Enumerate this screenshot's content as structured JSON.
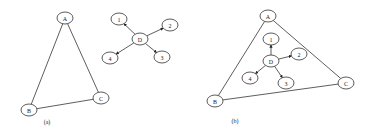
{
  "panels": [
    {
      "caption": "(a)",
      "caption_pos": [
        47,
        124
      ],
      "nodes": [
        {
          "id": "A",
          "label": "A",
          "x": 65,
          "y": 18
        },
        {
          "id": "B",
          "label": "B",
          "x": 29,
          "y": 110
        },
        {
          "id": "C",
          "label": "C",
          "x": 101,
          "y": 98
        },
        {
          "id": "D",
          "label": "D",
          "x": 140,
          "y": 39
        },
        {
          "id": "1",
          "label": "1",
          "x": 119,
          "y": 19
        },
        {
          "id": "2",
          "label": "2",
          "x": 170,
          "y": 25
        },
        {
          "id": "3",
          "label": "3",
          "x": 162,
          "y": 57
        },
        {
          "id": "4",
          "label": "4",
          "x": 110,
          "y": 58
        }
      ],
      "edges": [
        {
          "from": "A",
          "to": "B",
          "directed": false
        },
        {
          "from": "A",
          "to": "C",
          "directed": false
        },
        {
          "from": "B",
          "to": "C",
          "directed": false
        },
        {
          "from": "D",
          "to": "1",
          "directed": true
        },
        {
          "from": "D",
          "to": "2",
          "directed": true
        },
        {
          "from": "D",
          "to": "3",
          "directed": true
        },
        {
          "from": "D",
          "to": "4",
          "directed": true
        }
      ]
    },
    {
      "caption": "(b)",
      "caption_pos": [
        235,
        123
      ],
      "nodes": [
        {
          "id": "A",
          "label": "A",
          "x": 268,
          "y": 16
        },
        {
          "id": "B",
          "label": "B",
          "x": 215,
          "y": 101
        },
        {
          "id": "C",
          "label": "C",
          "x": 346,
          "y": 83
        },
        {
          "id": "D",
          "label": "D",
          "x": 271,
          "y": 61
        },
        {
          "id": "1",
          "label": "1",
          "x": 271,
          "y": 39
        },
        {
          "id": "2",
          "label": "2",
          "x": 299,
          "y": 54
        },
        {
          "id": "3",
          "label": "3",
          "x": 286,
          "y": 83
        },
        {
          "id": "4",
          "label": "4",
          "x": 250,
          "y": 78
        }
      ],
      "edges": [
        {
          "from": "A",
          "to": "B",
          "directed": false
        },
        {
          "from": "A",
          "to": "C",
          "directed": false
        },
        {
          "from": "B",
          "to": "C",
          "directed": false
        },
        {
          "from": "D",
          "to": "1",
          "directed": true
        },
        {
          "from": "D",
          "to": "2",
          "directed": true
        },
        {
          "from": "D",
          "to": "3",
          "directed": true
        },
        {
          "from": "D",
          "to": "4",
          "directed": true
        }
      ]
    }
  ],
  "style": {
    "stroke": "#333333",
    "background": "#ffffff",
    "node_rx": 8,
    "node_ry": 6
  }
}
